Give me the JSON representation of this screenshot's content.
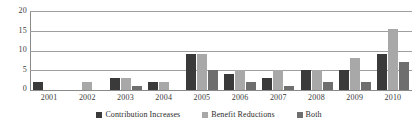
{
  "chart_data": {
    "type": "bar",
    "title": "",
    "subtitle": "",
    "xlabel": "",
    "ylabel": "",
    "categories": [
      "2001",
      "2002",
      "2003",
      "2004",
      "2005",
      "2006",
      "2007",
      "2008",
      "2009",
      "2010"
    ],
    "series": [
      {
        "name": "Contribution Increases",
        "color": "#3a3a3a",
        "values": [
          2,
          0,
          3,
          2,
          9,
          4,
          3,
          5,
          5,
          9
        ]
      },
      {
        "name": "Benefit Reductions",
        "color": "#a8a8a8",
        "values": [
          0,
          2,
          3,
          2,
          9,
          5,
          5,
          5,
          8,
          15.5
        ]
      },
      {
        "name": "Both",
        "color": "#6e6e6e",
        "values": [
          0,
          0,
          1,
          0,
          5,
          2,
          1,
          2,
          2,
          7
        ]
      }
    ],
    "ylim": [
      0,
      20
    ],
    "yticks": [
      20,
      15,
      10,
      5,
      0
    ],
    "ytick_labels": [
      "20",
      "15",
      "10",
      "5",
      "0"
    ],
    "grid": true,
    "grid_axis": "y",
    "legend_position": "bottom"
  },
  "colors": {
    "series_contribution_increases": "#3a3a3a",
    "series_benefit_reductions": "#a8a8a8",
    "series_both": "#6e6e6e",
    "gridline": "#9e9e9e",
    "axis": "#8a8a8a",
    "text": "#2b2b2b",
    "background": "#ffffff"
  }
}
